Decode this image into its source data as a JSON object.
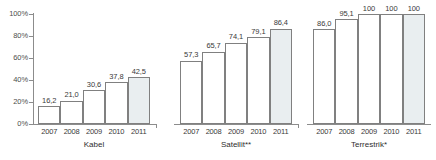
{
  "chart_data": {
    "type": "bar",
    "title": "",
    "subtitle": "",
    "xlabel": "",
    "ylabel": "",
    "ylim": [
      0,
      100
    ],
    "y_ticks": [
      "0%",
      "20%",
      "40%",
      "60%",
      "80%",
      "100%"
    ],
    "y_tick_values": [
      0,
      20,
      40,
      60,
      80,
      100
    ],
    "grid": false,
    "legend": null,
    "categories": [
      "2007",
      "2008",
      "2009",
      "2010",
      "2011"
    ],
    "groups": [
      {
        "name": "Kabel",
        "caption": "Kabel",
        "categories": [
          "2007",
          "2008",
          "2009",
          "2010",
          "2011"
        ],
        "values": [
          16.2,
          21.0,
          30.6,
          37.8,
          42.5
        ],
        "labels": [
          "16,2",
          "21,0",
          "30,6",
          "37,8",
          "42,5"
        ],
        "highlight_index": 4
      },
      {
        "name": "Satellit",
        "caption": "Satellit**",
        "categories": [
          "2007",
          "2008",
          "2009",
          "2010",
          "2011"
        ],
        "values": [
          57.3,
          65.7,
          74.1,
          79.1,
          86.4
        ],
        "labels": [
          "57,3",
          "65,7",
          "74,1",
          "79,1",
          "86,4"
        ],
        "highlight_index": 4
      },
      {
        "name": "Terrestrik",
        "caption": "Terrestrik*",
        "categories": [
          "2007",
          "2008",
          "2009",
          "2010",
          "2011"
        ],
        "values": [
          86.0,
          95.1,
          100,
          100,
          100
        ],
        "labels": [
          "86,0",
          "95,1",
          "100",
          "100",
          "100"
        ],
        "highlight_index": 4
      }
    ],
    "colors": {
      "bar_fill": "#ffffff",
      "bar_highlight_fill": "#e9eef0",
      "bar_stroke": "#808080",
      "axis": "#8c8c8c",
      "text": "#3a3a3a"
    }
  }
}
